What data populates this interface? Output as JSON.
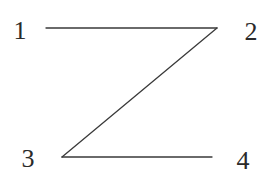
{
  "diagram": {
    "type": "z-path",
    "nodes": [
      {
        "id": "1",
        "label": "1",
        "x": 20,
        "y": 39
      },
      {
        "id": "2",
        "label": "2",
        "x": 251,
        "y": 40
      },
      {
        "id": "3",
        "label": "3",
        "x": 28,
        "y": 167
      },
      {
        "id": "4",
        "label": "4",
        "x": 243,
        "y": 169
      }
    ],
    "edges": [
      {
        "from": "1",
        "to": "2",
        "x1": 46,
        "y1": 28,
        "x2": 217,
        "y2": 28
      },
      {
        "from": "2",
        "to": "3",
        "x1": 217,
        "y1": 28,
        "x2": 62,
        "y2": 157
      },
      {
        "from": "3",
        "to": "4",
        "x1": 62,
        "y1": 157,
        "x2": 212,
        "y2": 157
      }
    ],
    "colors": {
      "line": "#3a3a3a",
      "text": "#2a2a2a",
      "background": "#ffffff"
    }
  }
}
